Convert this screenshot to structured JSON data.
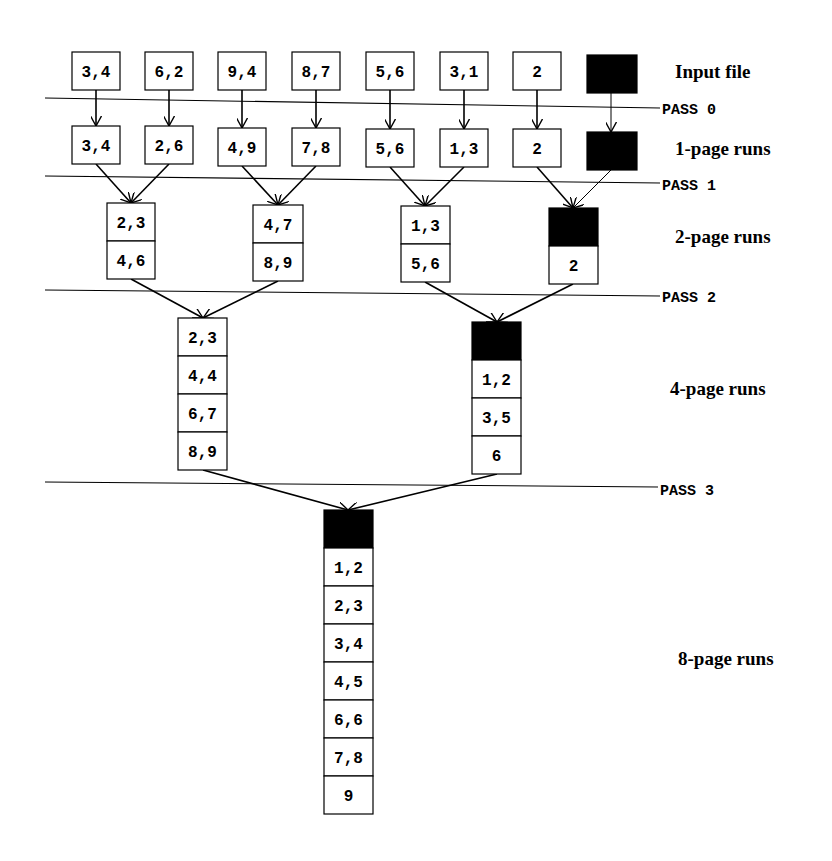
{
  "colors": {
    "stroke": "#000000",
    "background": "#ffffff",
    "empty_page": "#000000"
  },
  "levels": [
    {
      "label": "Input file",
      "label_pos": [
        675,
        78
      ],
      "runs": [
        {
          "x": 72,
          "y": 52,
          "w": 48,
          "pages": [
            "3,4"
          ]
        },
        {
          "x": 145,
          "y": 52,
          "w": 48,
          "pages": [
            "6,2"
          ]
        },
        {
          "x": 218,
          "y": 52,
          "w": 48,
          "pages": [
            "9,4"
          ]
        },
        {
          "x": 292,
          "y": 52,
          "w": 48,
          "pages": [
            "8,7"
          ]
        },
        {
          "x": 366,
          "y": 52,
          "w": 48,
          "pages": [
            "5,6"
          ]
        },
        {
          "x": 440,
          "y": 52,
          "w": 48,
          "pages": [
            "3,1"
          ]
        },
        {
          "x": 513,
          "y": 52,
          "w": 48,
          "pages": [
            "2"
          ]
        },
        {
          "x": 587,
          "y": 55,
          "w": 50,
          "pages": [
            ""
          ],
          "filled": [
            0
          ]
        }
      ],
      "page_height": 38
    },
    {
      "label": "1-page runs",
      "label_pos": [
        675,
        155
      ],
      "runs": [
        {
          "x": 72,
          "y": 126,
          "w": 48,
          "pages": [
            "3,4"
          ]
        },
        {
          "x": 145,
          "y": 126,
          "w": 48,
          "pages": [
            "2,6"
          ]
        },
        {
          "x": 218,
          "y": 128,
          "w": 48,
          "pages": [
            "4,9"
          ]
        },
        {
          "x": 292,
          "y": 128,
          "w": 48,
          "pages": [
            "7,8"
          ]
        },
        {
          "x": 366,
          "y": 129,
          "w": 48,
          "pages": [
            "5,6"
          ]
        },
        {
          "x": 440,
          "y": 129,
          "w": 48,
          "pages": [
            "1,3"
          ]
        },
        {
          "x": 513,
          "y": 129,
          "w": 48,
          "pages": [
            "2"
          ]
        },
        {
          "x": 587,
          "y": 132,
          "w": 50,
          "pages": [
            ""
          ],
          "filled": [
            0
          ]
        }
      ],
      "page_height": 38
    },
    {
      "label": "2-page runs",
      "label_pos": [
        675,
        243
      ],
      "runs": [
        {
          "x": 107,
          "y": 203,
          "w": 48,
          "pages": [
            "2,3",
            "4,6"
          ]
        },
        {
          "x": 253,
          "y": 205,
          "w": 50,
          "pages": [
            "4,7",
            "8,9"
          ]
        },
        {
          "x": 401,
          "y": 206,
          "w": 49,
          "pages": [
            "1,3",
            "5,6"
          ]
        },
        {
          "x": 549,
          "y": 208,
          "w": 49,
          "pages": [
            "",
            "2"
          ],
          "filled": [
            0
          ]
        }
      ],
      "page_height": 38
    },
    {
      "label": "4-page runs",
      "label_pos": [
        670,
        395
      ],
      "runs": [
        {
          "x": 178,
          "y": 318,
          "w": 49,
          "pages": [
            "2,3",
            "4,4",
            "6,7",
            "8,9"
          ]
        },
        {
          "x": 472,
          "y": 322,
          "w": 49,
          "pages": [
            "",
            "1,2",
            "3,5",
            "6"
          ],
          "filled": [
            0
          ]
        }
      ],
      "page_height": 38
    },
    {
      "label": "8-page runs",
      "label_pos": [
        678,
        665
      ],
      "runs": [
        {
          "x": 324,
          "y": 510,
          "w": 49,
          "pages": [
            "",
            "1,2",
            "2,3",
            "3,4",
            "4,5",
            "6,6",
            "7,8",
            "9"
          ],
          "filled": [
            0
          ]
        }
      ],
      "page_height": 38
    }
  ],
  "passes": [
    {
      "label": "PASS 0",
      "y1": 98,
      "y2": 108,
      "x1": 45,
      "x2": 660,
      "label_x": 662,
      "label_y": 114
    },
    {
      "label": "PASS 1",
      "y1": 176,
      "y2": 183,
      "x1": 45,
      "x2": 660,
      "label_x": 662,
      "label_y": 190
    },
    {
      "label": "PASS 2",
      "y1": 290,
      "y2": 296,
      "x1": 45,
      "x2": 660,
      "label_x": 662,
      "label_y": 302
    },
    {
      "label": "PASS 3",
      "y1": 482,
      "y2": 487,
      "x1": 45,
      "x2": 658,
      "label_x": 660,
      "label_y": 495
    }
  ],
  "arrows": [
    {
      "from": [
        96,
        90
      ],
      "to": [
        96,
        126
      ]
    },
    {
      "from": [
        169,
        90
      ],
      "to": [
        169,
        126
      ]
    },
    {
      "from": [
        242,
        90
      ],
      "to": [
        242,
        128
      ]
    },
    {
      "from": [
        316,
        90
      ],
      "to": [
        316,
        128
      ]
    },
    {
      "from": [
        390,
        90
      ],
      "to": [
        390,
        129
      ]
    },
    {
      "from": [
        464,
        90
      ],
      "to": [
        464,
        129
      ]
    },
    {
      "from": [
        537,
        90
      ],
      "to": [
        537,
        129
      ]
    },
    {
      "from": [
        611,
        93
      ],
      "to": [
        611,
        132
      ],
      "thin": true
    },
    {
      "from": [
        96,
        164
      ],
      "to": [
        131,
        203
      ]
    },
    {
      "from": [
        169,
        164
      ],
      "to": [
        131,
        203
      ]
    },
    {
      "from": [
        242,
        166
      ],
      "to": [
        278,
        205
      ]
    },
    {
      "from": [
        316,
        166
      ],
      "to": [
        278,
        205
      ]
    },
    {
      "from": [
        390,
        167
      ],
      "to": [
        425,
        206
      ]
    },
    {
      "from": [
        464,
        167
      ],
      "to": [
        425,
        206
      ]
    },
    {
      "from": [
        537,
        167
      ],
      "to": [
        573,
        208
      ]
    },
    {
      "from": [
        611,
        170
      ],
      "to": [
        573,
        208
      ],
      "thin": true
    },
    {
      "from": [
        131,
        279
      ],
      "to": [
        203,
        318
      ]
    },
    {
      "from": [
        278,
        281
      ],
      "to": [
        203,
        318
      ]
    },
    {
      "from": [
        425,
        282
      ],
      "to": [
        497,
        322
      ]
    },
    {
      "from": [
        573,
        284
      ],
      "to": [
        497,
        322
      ]
    },
    {
      "from": [
        203,
        470
      ],
      "to": [
        348,
        510
      ]
    },
    {
      "from": [
        497,
        474
      ],
      "to": [
        348,
        510
      ]
    }
  ]
}
